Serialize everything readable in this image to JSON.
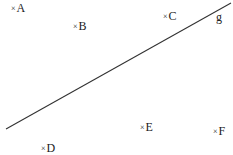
{
  "diagram": {
    "line": {
      "label": "g",
      "label_pos": [
        216,
        11
      ],
      "x1": 6,
      "y1": 129,
      "x2": 231,
      "y2": 3,
      "color": "#333333"
    },
    "points": [
      {
        "name": "A",
        "x": 11,
        "y": 2
      },
      {
        "name": "B",
        "x": 73,
        "y": 20
      },
      {
        "name": "C",
        "x": 163,
        "y": 10
      },
      {
        "name": "D",
        "x": 41,
        "y": 142
      },
      {
        "name": "E",
        "x": 140,
        "y": 121
      },
      {
        "name": "F",
        "x": 213,
        "y": 125
      }
    ],
    "marker": "×"
  }
}
